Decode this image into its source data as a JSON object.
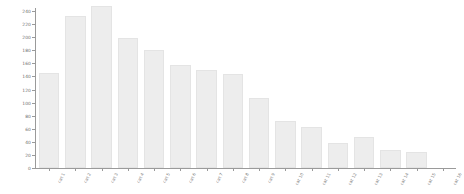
{
  "chart_data": {
    "type": "bar",
    "title": "",
    "subtitle": "",
    "xlabel": "",
    "ylabel": "",
    "ylim": [
      0,
      240
    ],
    "grid": false,
    "legend": null,
    "y_ticks": [
      0,
      20,
      40,
      60,
      80,
      100,
      120,
      140,
      160,
      180,
      200,
      220,
      240
    ],
    "categories": [
      "cat 1",
      "cat 2",
      "cat 3",
      "cat 4",
      "cat 5",
      "cat 6",
      "cat 7",
      "cat 8",
      "cat 9",
      "cat 10",
      "cat 11",
      "cat 12",
      "cat 13",
      "cat 14",
      "cat 15",
      "cat 16"
    ],
    "values": [
      145,
      232,
      248,
      198,
      181,
      157,
      150,
      143,
      107,
      72,
      62,
      38,
      48,
      28,
      24,
      0
    ],
    "bar_color": "#ededed",
    "bar_edge_color": "#e4e4e4",
    "axis_color": "#9a9a9a",
    "tick_label_color": "#6e6e6e",
    "background": "#ffffff"
  }
}
